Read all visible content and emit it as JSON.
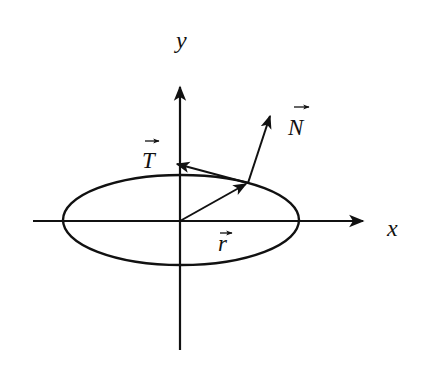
{
  "diagram": {
    "title": "",
    "colors": {
      "stroke": "#111111",
      "background": "#ffffff"
    },
    "axes": {
      "x": {
        "label": "x",
        "icon": "arrow-right-icon"
      },
      "y": {
        "label": "y",
        "icon": "arrow-up-icon"
      }
    },
    "curve": {
      "type": "ellipse",
      "label": ""
    },
    "vectors": [
      {
        "id": "r",
        "label": "r",
        "accent": "→",
        "description": "position vector from origin to point on ellipse"
      },
      {
        "id": "T",
        "label": "T",
        "accent": "→",
        "description": "tangent vector"
      },
      {
        "id": "N",
        "label": "N",
        "accent": "→",
        "description": "normal vector"
      }
    ]
  }
}
